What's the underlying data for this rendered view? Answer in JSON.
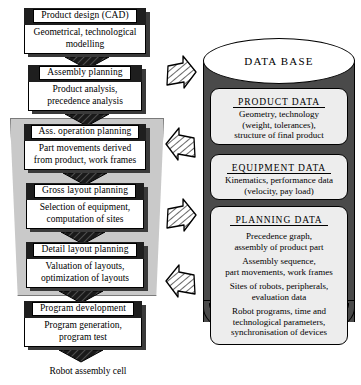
{
  "diagram": {
    "caption": "Robot assembly cell"
  },
  "flow": {
    "stages": [
      {
        "id": "product-design",
        "header": "Product design (CAD)",
        "body": "Geometrical, technological\nmodelling"
      },
      {
        "id": "assembly-planning",
        "header": "Assembly planning",
        "body": "Product analysis,\nprecedence analysis"
      },
      {
        "id": "ass-operation-planning",
        "header": "Ass. operation planning",
        "body": "Part movements derived\nfrom product, work frames"
      },
      {
        "id": "gross-layout-planning",
        "header": "Gross layout planning",
        "body": "Selection of equipment,\ncomputation of sites"
      },
      {
        "id": "detail-layout-planning",
        "header": "Detail layout planning",
        "body": "Valuation of layouts,\noptimization of layouts"
      },
      {
        "id": "program-development",
        "header": "Program development",
        "body": "Program generation,\nprogram test"
      }
    ]
  },
  "connectors": {
    "down_arrow_name": "down-arrow",
    "side_arrows": [
      {
        "id": "side-arrow-1",
        "direction": "right"
      },
      {
        "id": "side-arrow-2",
        "direction": "left"
      },
      {
        "id": "side-arrow-3",
        "direction": "right"
      },
      {
        "id": "side-arrow-4",
        "direction": "left"
      }
    ]
  },
  "database": {
    "title": "DATA BASE",
    "panels": [
      {
        "id": "product-data",
        "title": "PRODUCT DATA",
        "text": "Geometry, technology\n(weight, tolerances),\nstructure of final product"
      },
      {
        "id": "equipment-data",
        "title": "EQUIPMENT DATA",
        "text": "Kinematics, performance data\n(velocity, pay load)"
      },
      {
        "id": "planning-data",
        "title": "PLANNING DATA",
        "groups": [
          "Precedence graph,\nassembly of product part",
          "Assembly sequence,\npart movements, work frames",
          "Sites of robots, peripherals,\nevaluation data",
          "Robot programs, time and\ntechnological parameters,\nsynchronisation of devices"
        ]
      }
    ]
  },
  "colors": {
    "backdrop_gray": "#c9c9c9",
    "cylinder_dark": "#4a4a4a",
    "panel_fill": "#ededed",
    "header_black": "#1e1e1e",
    "shadow_gray": "#3a3a3a"
  }
}
